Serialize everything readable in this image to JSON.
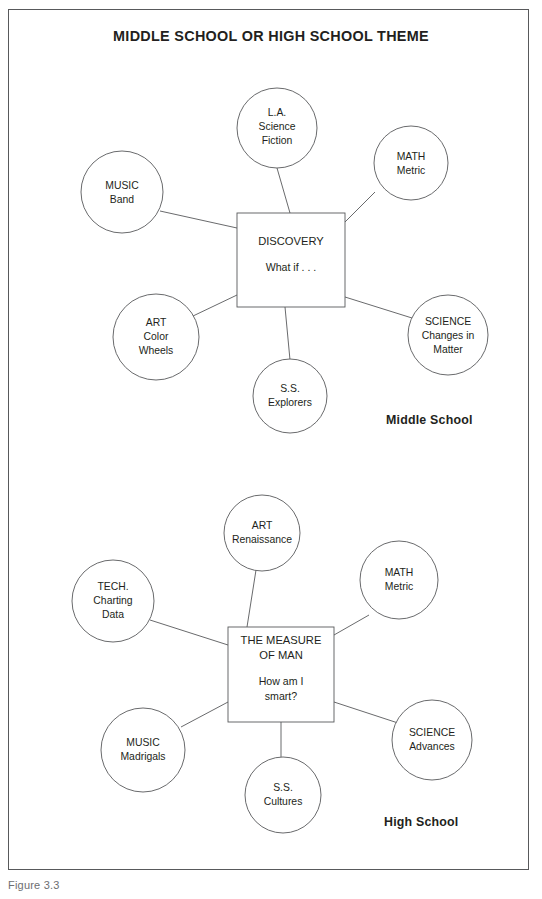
{
  "document": {
    "title": "MIDDLE SCHOOL OR HIGH SCHOOL THEME",
    "caption": "Figure 3.3"
  },
  "diagrams": [
    {
      "id": "middle-school",
      "level_label": "Middle School",
      "center": {
        "heading": "DISCOVERY",
        "subheading": "What if . . ."
      },
      "nodes": [
        {
          "id": "la",
          "subject": "L.A.",
          "detail_line1": "Science",
          "detail_line2": "Fiction"
        },
        {
          "id": "math",
          "subject": "MATH",
          "detail_line1": "Metric",
          "detail_line2": ""
        },
        {
          "id": "science",
          "subject": "SCIENCE",
          "detail_line1": "Changes in",
          "detail_line2": "Matter"
        },
        {
          "id": "ss",
          "subject": "S.S.",
          "detail_line1": "Explorers",
          "detail_line2": ""
        },
        {
          "id": "art",
          "subject": "ART",
          "detail_line1": "Color",
          "detail_line2": "Wheels"
        },
        {
          "id": "music",
          "subject": "MUSIC",
          "detail_line1": "Band",
          "detail_line2": ""
        }
      ]
    },
    {
      "id": "high-school",
      "level_label": "High School",
      "center": {
        "heading_line1": "THE MEASURE",
        "heading_line2": "OF MAN",
        "subheading_line1": "How am I",
        "subheading_line2": "smart?"
      },
      "nodes": [
        {
          "id": "art",
          "subject": "ART",
          "detail_line1": "Renaissance",
          "detail_line2": ""
        },
        {
          "id": "math",
          "subject": "MATH",
          "detail_line1": "Metric",
          "detail_line2": ""
        },
        {
          "id": "science",
          "subject": "SCIENCE",
          "detail_line1": "Advances",
          "detail_line2": ""
        },
        {
          "id": "ss",
          "subject": "S.S.",
          "detail_line1": "Cultures",
          "detail_line2": ""
        },
        {
          "id": "music",
          "subject": "MUSIC",
          "detail_line1": "Madrigals",
          "detail_line2": ""
        },
        {
          "id": "tech",
          "subject": "TECH.",
          "detail_line1": "Charting",
          "detail_line2": "Data"
        }
      ]
    }
  ],
  "colors": {
    "stroke": "#58595b",
    "text": "#231f20",
    "background": "#ffffff"
  }
}
